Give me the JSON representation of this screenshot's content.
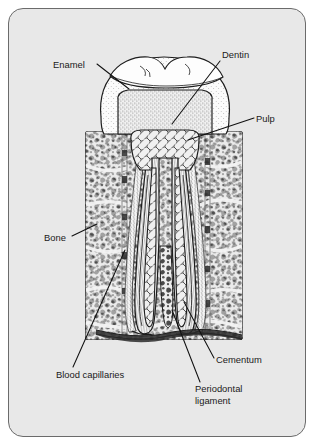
{
  "figure": {
    "kind": "anatomical-cross-section",
    "panel": {
      "background_color": "#e8e8e8",
      "border_color": "#6b6b6b",
      "outer_background_color": "#ffffff",
      "corner_radius_px": 15
    },
    "ink_color": "#111111"
  },
  "labels": [
    {
      "id": "enamel",
      "text": "Enamel",
      "text2": "",
      "x": 53,
      "y": 68,
      "anchor": "start"
    },
    {
      "id": "dentin",
      "text": "Dentin",
      "text2": "",
      "x": 222,
      "y": 58,
      "anchor": "start"
    },
    {
      "id": "pulp",
      "text": "Pulp",
      "text2": "",
      "x": 256,
      "y": 122,
      "anchor": "start"
    },
    {
      "id": "bone",
      "text": "Bone",
      "text2": "",
      "x": 44,
      "y": 241,
      "anchor": "start"
    },
    {
      "id": "blood-capillaries",
      "text": "Blood capillaries",
      "text2": "",
      "x": 56,
      "y": 378,
      "anchor": "start"
    },
    {
      "id": "periodontal-ligament",
      "text": "Periodontal",
      "text2": "ligament",
      "x": 195,
      "y": 392,
      "anchor": "start"
    },
    {
      "id": "cementum",
      "text": "Cementum",
      "text2": "",
      "x": 216,
      "y": 363,
      "anchor": "start"
    }
  ],
  "leader_lines": [
    {
      "id": "enamel-leader",
      "path": "M97,64 L129,89"
    },
    {
      "id": "dentin-leader",
      "path": "M220,61 L172,124"
    },
    {
      "id": "pulp-leader",
      "path": "M254,118 L188,140"
    },
    {
      "id": "bone-leader",
      "path": "M72,236 L97,224"
    },
    {
      "id": "blood-capillaries-leader",
      "path": "M73,367 L125,250"
    },
    {
      "id": "periodontal-ligament-leader",
      "path": "M200,382 L172,310"
    },
    {
      "id": "cementum-leader",
      "path": "M214,358 L184,302"
    }
  ],
  "structures": {
    "crown": {
      "name": "crown",
      "note": "molar cusps with stippled enamel shell"
    },
    "enamel_layer": {
      "name": "enamel",
      "fill": "stipple-light"
    },
    "dentin_core": {
      "name": "dentin",
      "fill": "stipple-dense"
    },
    "pulp_chamber": {
      "name": "pulp",
      "fill": "vascular-mesh"
    },
    "root_canals": {
      "name": "root-canals",
      "count": 2
    },
    "cementum_layer": {
      "name": "cementum",
      "fill": "thin-outer-line"
    },
    "periodontal_ligament": {
      "name": "periodontal-ligament",
      "fill": "fiber-striation"
    },
    "alveolar_bone": {
      "name": "bone",
      "fill": "trabecular-cells"
    },
    "bone_block": {
      "x": 85,
      "y": 131,
      "width": 158,
      "height": 209
    }
  }
}
